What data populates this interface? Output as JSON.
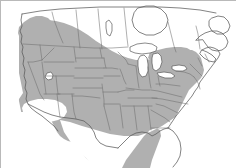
{
  "figure": {
    "kind": "range-map",
    "region": "North America",
    "title": "",
    "caption": "",
    "width_px": 236,
    "height_px": 168
  },
  "colors": {
    "range_shading": "#b0b0b0",
    "background": "#ffffff",
    "water": "#ffffff",
    "coastline_outline": "#5a5a5a",
    "subdivision_border": "#6e6e6e",
    "image_frame": "#b9b9b9"
  },
  "legend": {
    "present": false,
    "items": []
  },
  "labels": {
    "visible_text": []
  },
  "map_features": {
    "shaded_range_description": "Contiguous shaded distribution covering most of the lower 48 United States, extending north along the Pacific coast into southern British Columbia and across the southern Canadian prairies and southern Ontario/Quebec, and south to the Gulf Coast and Florida.",
    "unshaded_areas": [
      "Northern and central Canada",
      "Hudson Bay",
      "Southwestern desert gap (southern California / southwestern Arizona)",
      "Great Lakes",
      "Atlantic Ocean",
      "Pacific Ocean",
      "Gulf of Mexico"
    ],
    "water_bodies": [
      "Lake Superior",
      "Lake Michigan",
      "Lake Huron",
      "Lake Erie",
      "Lake Ontario",
      "Hudson Bay",
      "Great Salt Lake",
      "Gulf of St. Lawrence"
    ],
    "subdivisions_shown": "US state boundaries and Canadian province boundaries"
  },
  "chart_data": {
    "type": "map",
    "title": "",
    "projection": "continental North America",
    "categories": [
      "within range",
      "outside range"
    ],
    "values": [
      1,
      0
    ],
    "series": [
      {
        "name": "within range",
        "color": "#b0b0b0",
        "description": "shaded distribution area"
      },
      {
        "name": "outside range",
        "color": "#ffffff",
        "description": "unshaded land and water"
      }
    ]
  }
}
